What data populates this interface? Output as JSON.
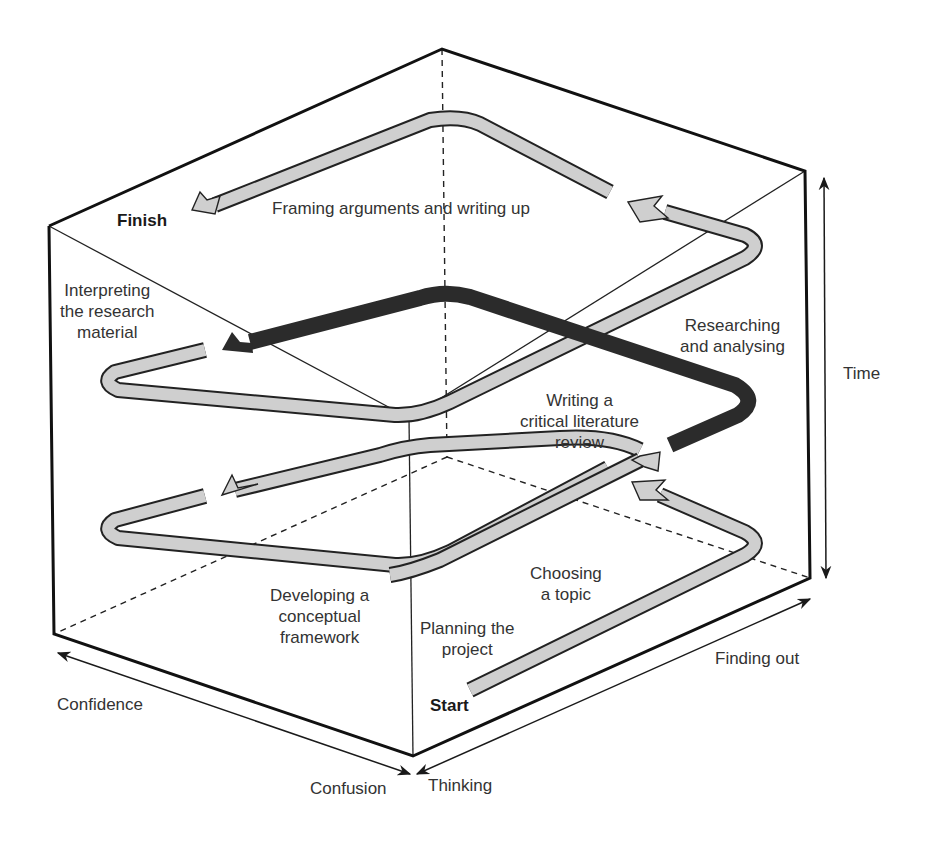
{
  "diagram": {
    "type": "3D cube with spiral research-process path",
    "colors": {
      "edge": "#1a1a1a",
      "arrow_light_fill": "#cfcfcf",
      "arrow_dark_fill": "#2b2b2b",
      "outline": "#222222",
      "text": "#333333"
    },
    "endpoints": {
      "start": "Start",
      "finish": "Finish"
    },
    "stages": [
      {
        "id": "planning",
        "label": "Planning the\nproject"
      },
      {
        "id": "choosing",
        "label": "Choosing\na topic"
      },
      {
        "id": "literature",
        "label": "Writing a\ncritical literature\nreview"
      },
      {
        "id": "conceptual",
        "label": "Developing a\nconceptual\nframework"
      },
      {
        "id": "researching",
        "label": "Researching\nand analysing"
      },
      {
        "id": "interpreting",
        "label": "Interpreting\nthe research\nmaterial"
      },
      {
        "id": "framing",
        "label": "Framing arguments and writing up"
      }
    ],
    "axes": {
      "time": "Time",
      "finding_out": "Finding out",
      "thinking": "Thinking",
      "confusion": "Confusion",
      "confidence": "Confidence"
    }
  }
}
